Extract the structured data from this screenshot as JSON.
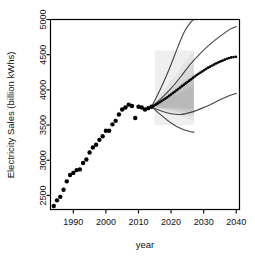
{
  "chart_data": {
    "type": "scatter",
    "title": "",
    "subtitle": "",
    "xlabel": "year",
    "ylabel": "Electricity Sales (billion kWhs)",
    "xlim": [
      1983,
      2041
    ],
    "ylim": [
      2300,
      5000
    ],
    "grid": false,
    "legend_position": "none",
    "xticks": [
      1990,
      2000,
      2010,
      2020,
      2030,
      2040
    ],
    "xtick_labels": [
      "1990",
      "2000",
      "2010",
      "2020",
      "2030",
      "2040"
    ],
    "yticks": [
      2500,
      3000,
      3500,
      4000,
      4500,
      5000
    ],
    "ytick_labels": [
      "2500",
      "3000",
      "3500",
      "4000",
      "4500",
      "5000"
    ],
    "series": [
      {
        "name": "Historical electricity sales",
        "style": "filled-circle-markers",
        "color": "#000000",
        "x": [
          1984,
          1985,
          1986,
          1987,
          1988,
          1989,
          1990,
          1991,
          1992,
          1993,
          1994,
          1995,
          1996,
          1997,
          1998,
          1999,
          2000,
          2001,
          2002,
          2003,
          2004,
          2005,
          2006,
          2007,
          2008,
          2009,
          2010,
          2011,
          2012,
          2013,
          2014
        ],
        "y": [
          2350,
          2430,
          2480,
          2580,
          2700,
          2790,
          2820,
          2860,
          2870,
          2960,
          3010,
          3110,
          3180,
          3220,
          3290,
          3340,
          3420,
          3420,
          3510,
          3560,
          3650,
          3720,
          3750,
          3790,
          3770,
          3600,
          3760,
          3750,
          3720,
          3740,
          3760
        ]
      },
      {
        "name": "Central forecast (dotted)",
        "style": "dotted-circle-markers",
        "color": "#000000",
        "x": [
          2014,
          2015,
          2016,
          2017,
          2018,
          2019,
          2020,
          2021,
          2022,
          2023,
          2024,
          2025,
          2026,
          2027,
          2028,
          2029,
          2030,
          2031,
          2032,
          2033,
          2034,
          2035,
          2036,
          2037,
          2038,
          2039,
          2040
        ],
        "y": [
          3760,
          3780,
          3810,
          3840,
          3870,
          3900,
          3935,
          3970,
          4005,
          4040,
          4075,
          4110,
          4145,
          4180,
          4215,
          4245,
          4275,
          4305,
          4330,
          4355,
          4380,
          4400,
          4420,
          4440,
          4455,
          4465,
          4470
        ]
      },
      {
        "name": "Scenario high-growth (steep)",
        "style": "line",
        "color": "#444444",
        "x": [
          2014,
          2016,
          2018,
          2020,
          2022,
          2024,
          2026,
          2027
        ],
        "y": [
          3760,
          3940,
          4140,
          4360,
          4600,
          4820,
          4960,
          5000
        ]
      },
      {
        "name": "Scenario upper",
        "style": "line",
        "color": "#444444",
        "x": [
          2014,
          2017,
          2020,
          2023,
          2026,
          2029,
          2032,
          2035,
          2038,
          2040
        ],
        "y": [
          3760,
          3880,
          4020,
          4190,
          4370,
          4520,
          4650,
          4760,
          4860,
          4900
        ]
      },
      {
        "name": "Scenario lower",
        "style": "line",
        "color": "#444444",
        "x": [
          2014,
          2017,
          2020,
          2023,
          2026,
          2029,
          2032,
          2035,
          2038,
          2040
        ],
        "y": [
          3760,
          3700,
          3660,
          3650,
          3680,
          3730,
          3790,
          3860,
          3920,
          3950
        ]
      },
      {
        "name": "Scenario decline",
        "style": "line",
        "color": "#444444",
        "x": [
          2014,
          2017,
          2020,
          2023,
          2026,
          2027
        ],
        "y": [
          3760,
          3640,
          3530,
          3450,
          3405,
          3400
        ]
      }
    ],
    "density_cloud": {
      "description": "grey probabilistic density fan",
      "x_range": [
        2015,
        2027
      ],
      "y_range": [
        3500,
        4560
      ],
      "color": "#999999"
    },
    "annotations": []
  },
  "axes": {
    "x_title": "year",
    "y_title": "Electricity Sales (billion kWhs)"
  }
}
